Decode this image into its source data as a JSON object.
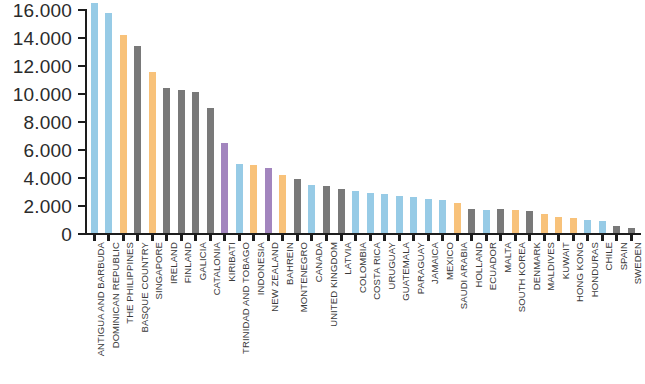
{
  "chart_data": {
    "type": "bar",
    "title": "",
    "subtitle": "",
    "xlabel": "",
    "ylabel": "",
    "ylim": [
      0,
      16000
    ],
    "grid": false,
    "legend": "none",
    "y_tick_labels": [
      "16.000",
      "14.000",
      "12.000",
      "10.000",
      "8.000",
      "6.000",
      "4.000",
      "2.000",
      "0"
    ],
    "y_tick_values": [
      16000,
      14000,
      12000,
      10000,
      8000,
      6000,
      4000,
      2000,
      0
    ],
    "y_tick_step": 2000,
    "categories": [
      "ANTIGUA AND BARBUDA",
      "DOMINICAN REPUBLIC",
      "THE PHILIPPINES",
      "BASQUE COUNTRY",
      "SINGAPORE",
      "IRELAND",
      "FINLAND",
      "GALICIA",
      "CATALONIA",
      "KIRIBATI",
      "TRINIDAD AND TOBAGO",
      "INDONESIA",
      "NEW ZEALAND",
      "BAHREIN",
      "MONTENEGRO",
      "CANADA",
      "UNITED KINGDOM",
      "LATVIA",
      "COLOMBIA",
      "COSTA RICA",
      "URUGUAY",
      "GUATEMALA",
      "PARAGUAY",
      "JAMAICA",
      "MEXICO",
      "SAUDI ARABIA",
      "HOLLAND",
      "ECUADOR",
      "MALTA",
      "SOUTH KOREA",
      "DENMARK",
      "MALDIVES",
      "KUWAIT",
      "HONG KONG",
      "HONDURAS",
      "CHILE",
      "SPAIN",
      "SWEDEN"
    ],
    "values": [
      16500,
      15800,
      14200,
      13400,
      11600,
      10400,
      10300,
      10150,
      9000,
      6500,
      5000,
      4900,
      4700,
      4250,
      3900,
      3500,
      3400,
      3250,
      3050,
      2950,
      2850,
      2750,
      2650,
      2500,
      2400,
      2250,
      1800,
      1700,
      1800,
      1700,
      1650,
      1400,
      1250,
      1150,
      1000,
      900,
      600,
      450
    ],
    "bar_colors": [
      "#8ec7e4",
      "#8ec7e4",
      "#f7bd6f",
      "#6e6e6e",
      "#f7bd6f",
      "#6e6e6e",
      "#6e6e6e",
      "#6e6e6e",
      "#6e6e6e",
      "#9a7bb8",
      "#8ec7e4",
      "#f7bd6f",
      "#9a7bb8",
      "#f7bd6f",
      "#6e6e6e",
      "#8ec7e4",
      "#6e6e6e",
      "#6e6e6e",
      "#8ec7e4",
      "#8ec7e4",
      "#8ec7e4",
      "#8ec7e4",
      "#8ec7e4",
      "#8ec7e4",
      "#8ec7e4",
      "#f7bd6f",
      "#6e6e6e",
      "#8ec7e4",
      "#6e6e6e",
      "#f7bd6f",
      "#6e6e6e",
      "#f7bd6f",
      "#f7bd6f",
      "#f7bd6f",
      "#8ec7e4",
      "#8ec7e4",
      "#6e6e6e",
      "#6e6e6e"
    ],
    "palette": {
      "blue": "#8ec7e4",
      "orange": "#f7bd6f",
      "gray": "#6e6e6e",
      "purple": "#9a7bb8",
      "axis": "#1d1d1d",
      "text": "#2b2b2b",
      "background": "#ffffff"
    }
  }
}
